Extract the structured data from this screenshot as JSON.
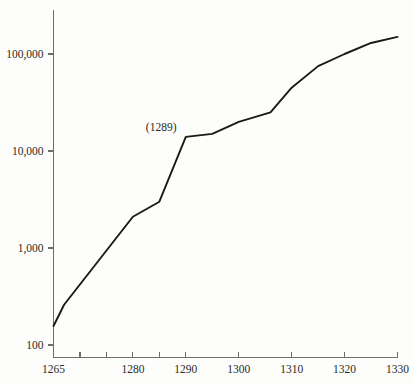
{
  "chart_data": {
    "type": "line",
    "title": "",
    "subtitle": "",
    "xlabel": "",
    "ylabel": "",
    "yscale": "log",
    "xscale": "linear",
    "xlim": [
      1265,
      1330
    ],
    "ylim": [
      100,
      200000
    ],
    "grid": false,
    "legend": false,
    "legend_position": "none",
    "x_tick_labels": [
      "1265",
      "1280",
      "1290",
      "1300",
      "1310",
      "1320",
      "1330"
    ],
    "x_tick_values": [
      1265,
      1280,
      1290,
      1300,
      1310,
      1320,
      1330
    ],
    "x_minor_tick_values": [
      1270,
      1275,
      1285
    ],
    "y_tick_labels": [
      "100",
      "1,000",
      "10,000",
      "100,000"
    ],
    "y_tick_values": [
      100,
      1000,
      10000,
      100000
    ],
    "series": [
      {
        "name": "series-1",
        "color": "#1a1a18",
        "x": [
          1265,
          1267,
          1280,
          1285,
          1290,
          1295,
          1300,
          1306,
          1310,
          1315,
          1320,
          1325,
          1330
        ],
        "values": [
          157,
          260,
          2100,
          3000,
          14000,
          15000,
          20000,
          25000,
          45000,
          75000,
          100000,
          130000,
          150000
        ]
      }
    ],
    "annotations": [
      {
        "text": "(1289)",
        "x": 1289,
        "y": 14000
      }
    ]
  },
  "axes": {
    "y_axis_name": "y-axis",
    "x_axis_name": "x-axis"
  }
}
